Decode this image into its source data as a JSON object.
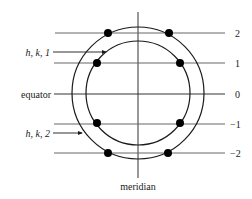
{
  "diagram": {
    "colors": {
      "ink": "#1a1a1a",
      "line": "#555555",
      "background": "#ffffff"
    },
    "axes": {
      "equator_label": "equator",
      "meridian_label": "meridian"
    },
    "circles": [
      {
        "name": "outer",
        "cx": 138,
        "cy": 93,
        "r": 66
      },
      {
        "name": "inner",
        "cx": 138,
        "cy": 93,
        "r": 52
      }
    ],
    "levels": [
      {
        "label": "2",
        "y": 33
      },
      {
        "label": "1",
        "y": 63
      },
      {
        "label": "0",
        "y": 94
      },
      {
        "label": "−1",
        "y": 124
      },
      {
        "label": "−2",
        "y": 153
      }
    ],
    "annotations": [
      {
        "label": "h, k, 1",
        "target": "inner circle",
        "y": 52
      },
      {
        "label": "h, k, 2",
        "target": "outer circle",
        "y": 133
      }
    ],
    "points": [
      {
        "x": 108,
        "y": 33
      },
      {
        "x": 169,
        "y": 33
      },
      {
        "x": 97,
        "y": 63
      },
      {
        "x": 180,
        "y": 63
      },
      {
        "x": 97,
        "y": 123
      },
      {
        "x": 180,
        "y": 123
      },
      {
        "x": 108,
        "y": 153
      },
      {
        "x": 168,
        "y": 153
      }
    ]
  }
}
